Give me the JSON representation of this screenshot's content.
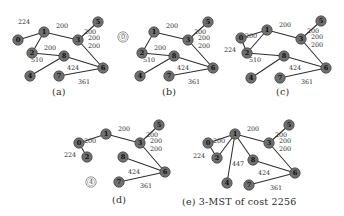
{
  "figure": {
    "type": "graph-algorithm-diagram",
    "node_fill_color": "#6f6f6f",
    "edge_color": "#2e2e2e",
    "open_node_color": "#ffffff",
    "panels": [
      {
        "id": "a",
        "caption": "(a)",
        "nodes": [
          {
            "id": "n0",
            "label": "0",
            "x": 16,
            "y": 40,
            "state": "filled"
          },
          {
            "id": "n1",
            "label": "1",
            "x": 42,
            "y": 32,
            "state": "filled"
          },
          {
            "id": "n2",
            "label": "2",
            "x": 30,
            "y": 53,
            "state": "filled"
          },
          {
            "id": "n3",
            "label": "3",
            "x": 76,
            "y": 40,
            "state": "filled"
          },
          {
            "id": "n5",
            "label": "5",
            "x": 96,
            "y": 22,
            "state": "filled"
          },
          {
            "id": "n8",
            "label": "8",
            "x": 62,
            "y": 56,
            "state": "filled"
          },
          {
            "id": "n4",
            "label": "4",
            "x": 28,
            "y": 76,
            "state": "filled"
          },
          {
            "id": "n7",
            "label": "7",
            "x": 57,
            "y": 76,
            "state": "filled"
          },
          {
            "id": "n6",
            "label": "6",
            "x": 101,
            "y": 68,
            "state": "filled"
          }
        ],
        "edges": [
          {
            "from": "n0",
            "to": "n1",
            "weight": "224",
            "wx": 22,
            "wy": 22
          },
          {
            "from": "n1",
            "to": "n2",
            "weight": "510",
            "wx": 35,
            "wy": 60
          },
          {
            "from": "n1",
            "to": "n3",
            "weight": "200",
            "wx": 60,
            "wy": 26
          },
          {
            "from": "n3",
            "to": "n5",
            "weight": "200",
            "wx": 88,
            "wy": 32
          },
          {
            "from": "n3",
            "to": "n6",
            "weight": "200",
            "wx": 92,
            "wy": 46
          },
          {
            "from": "n2",
            "to": "n8",
            "weight": "200",
            "wx": 48,
            "wy": 48
          },
          {
            "from": "n8",
            "to": "n4",
            "weight": "",
            "wx": 0,
            "wy": 0
          },
          {
            "from": "n8",
            "to": "n6",
            "weight": "424",
            "wx": 71,
            "wy": 68
          },
          {
            "from": "n7",
            "to": "n6",
            "weight": "361",
            "wx": 82,
            "wy": 82
          }
        ],
        "extra_weights": [
          {
            "text": "200",
            "x": 92,
            "y": 38
          }
        ]
      },
      {
        "id": "b",
        "caption": "(b)",
        "nodes": [
          {
            "id": "n0",
            "label": "0",
            "x": 11,
            "y": 37,
            "state": "open"
          },
          {
            "id": "n1",
            "label": "1",
            "x": 42,
            "y": 32,
            "state": "filled"
          },
          {
            "id": "n2",
            "label": "2",
            "x": 30,
            "y": 53,
            "state": "filled"
          },
          {
            "id": "n3",
            "label": "3",
            "x": 76,
            "y": 40,
            "state": "filled"
          },
          {
            "id": "n5",
            "label": "5",
            "x": 96,
            "y": 22,
            "state": "filled"
          },
          {
            "id": "n8",
            "label": "8",
            "x": 62,
            "y": 56,
            "state": "filled"
          },
          {
            "id": "n4",
            "label": "4",
            "x": 28,
            "y": 76,
            "state": "filled"
          },
          {
            "id": "n7",
            "label": "7",
            "x": 57,
            "y": 76,
            "state": "filled"
          },
          {
            "id": "n6",
            "label": "6",
            "x": 101,
            "y": 68,
            "state": "filled"
          }
        ],
        "edges": [
          {
            "from": "n1",
            "to": "n2",
            "weight": "510",
            "wx": 37,
            "wy": 60
          },
          {
            "from": "n1",
            "to": "n3",
            "weight": "200",
            "wx": 60,
            "wy": 26
          },
          {
            "from": "n3",
            "to": "n5",
            "weight": "200",
            "wx": 88,
            "wy": 32
          },
          {
            "from": "n3",
            "to": "n6",
            "weight": "200",
            "wx": 92,
            "wy": 46
          },
          {
            "from": "n2",
            "to": "n8",
            "weight": "200",
            "wx": 48,
            "wy": 48
          },
          {
            "from": "n8",
            "to": "n4",
            "weight": "",
            "wx": 0,
            "wy": 0
          },
          {
            "from": "n8",
            "to": "n6",
            "weight": "424",
            "wx": 71,
            "wy": 68
          },
          {
            "from": "n7",
            "to": "n6",
            "weight": "361",
            "wx": 82,
            "wy": 82
          }
        ],
        "extra_weights": [
          {
            "text": "200",
            "x": 92,
            "y": 38
          }
        ]
      },
      {
        "id": "c",
        "caption": "(c)",
        "nodes": [
          {
            "id": "n0",
            "label": "0",
            "x": 19,
            "y": 36,
            "state": "filled"
          },
          {
            "id": "n1",
            "label": "1",
            "x": 45,
            "y": 28,
            "state": "filled"
          },
          {
            "id": "n2",
            "label": "2",
            "x": 25,
            "y": 51,
            "state": "filled"
          },
          {
            "id": "n3",
            "label": "3",
            "x": 79,
            "y": 37,
            "state": "filled"
          },
          {
            "id": "n5",
            "label": "5",
            "x": 99,
            "y": 19,
            "state": "filled"
          },
          {
            "id": "n8",
            "label": "8",
            "x": 62,
            "y": 54,
            "state": "filled"
          },
          {
            "id": "n4",
            "label": "4",
            "x": 29,
            "y": 76,
            "state": "filled"
          },
          {
            "id": "n7",
            "label": "7",
            "x": 58,
            "y": 76,
            "state": "filled"
          },
          {
            "id": "n6",
            "label": "6",
            "x": 104,
            "y": 66,
            "state": "filled"
          }
        ],
        "edges": [
          {
            "from": "n0",
            "to": "n2",
            "weight": "200",
            "wx": 29,
            "wy": 34
          },
          {
            "from": "n0",
            "to": "n1",
            "weight": "",
            "wx": 0,
            "wy": 0
          },
          {
            "from": "n1",
            "to": "n2",
            "weight": "510",
            "wx": 33,
            "wy": 58
          },
          {
            "from": "n1",
            "to": "n3",
            "weight": "200",
            "wx": 63,
            "wy": 23
          },
          {
            "from": "n3",
            "to": "n5",
            "weight": "200",
            "wx": 91,
            "wy": 29
          },
          {
            "from": "n3",
            "to": "n6",
            "weight": "200",
            "wx": 95,
            "wy": 43
          },
          {
            "from": "n2",
            "to": "n8",
            "weight": "",
            "wx": 0,
            "wy": 0
          },
          {
            "from": "n8",
            "to": "n4",
            "weight": "",
            "wx": 0,
            "wy": 0
          },
          {
            "from": "n8",
            "to": "n6",
            "weight": "424",
            "wx": 73,
            "wy": 66
          },
          {
            "from": "n7",
            "to": "n6",
            "weight": "361",
            "wx": 85,
            "wy": 80
          }
        ],
        "extra_weights": [
          {
            "text": "224",
            "x": 8,
            "y": 48
          },
          {
            "text": "200",
            "x": 95,
            "y": 35
          }
        ]
      },
      {
        "id": "d",
        "caption": "(d)",
        "nodes": [
          {
            "id": "n0",
            "label": "0",
            "x": 19,
            "y": 33,
            "state": "filled"
          },
          {
            "id": "n1",
            "label": "1",
            "x": 46,
            "y": 24,
            "state": "filled"
          },
          {
            "id": "n2",
            "label": "2",
            "x": 27,
            "y": 47,
            "state": "filled"
          },
          {
            "id": "n3",
            "label": "3",
            "x": 80,
            "y": 33,
            "state": "filled"
          },
          {
            "id": "n5",
            "label": "5",
            "x": 99,
            "y": 15,
            "state": "filled"
          },
          {
            "id": "n8",
            "label": "8",
            "x": 63,
            "y": 47,
            "state": "filled"
          },
          {
            "id": "n4",
            "label": "4",
            "x": 31,
            "y": 72,
            "state": "open"
          },
          {
            "id": "n7",
            "label": "7",
            "x": 59,
            "y": 72,
            "state": "filled"
          },
          {
            "id": "n6",
            "label": "6",
            "x": 105,
            "y": 62,
            "state": "filled"
          }
        ],
        "edges": [
          {
            "from": "n0",
            "to": "n2",
            "weight": "200",
            "wx": 30,
            "wy": 31
          },
          {
            "from": "n0",
            "to": "n1",
            "weight": "",
            "wx": 0,
            "wy": 0
          },
          {
            "from": "n1",
            "to": "n3",
            "weight": "200",
            "wx": 64,
            "wy": 19
          },
          {
            "from": "n3",
            "to": "n5",
            "weight": "200",
            "wx": 92,
            "wy": 25
          },
          {
            "from": "n3",
            "to": "n6",
            "weight": "200",
            "wx": 96,
            "wy": 39
          },
          {
            "from": "n8",
            "to": "n6",
            "weight": "424",
            "wx": 74,
            "wy": 62
          },
          {
            "from": "n7",
            "to": "n6",
            "weight": "361",
            "wx": 86,
            "wy": 76
          }
        ],
        "extra_weights": [
          {
            "text": "224",
            "x": 10,
            "y": 45
          },
          {
            "text": "200",
            "x": 96,
            "y": 31
          }
        ]
      },
      {
        "id": "e",
        "caption": "(e) 3-MST of cost 2256",
        "nodes": [
          {
            "id": "n0",
            "label": "0",
            "x": 22,
            "y": 33,
            "state": "filled"
          },
          {
            "id": "n1",
            "label": "1",
            "x": 49,
            "y": 24,
            "state": "filled"
          },
          {
            "id": "n2",
            "label": "2",
            "x": 31,
            "y": 48,
            "state": "filled"
          },
          {
            "id": "n3",
            "label": "3",
            "x": 83,
            "y": 33,
            "state": "filled"
          },
          {
            "id": "n5",
            "label": "5",
            "x": 103,
            "y": 15,
            "state": "filled"
          },
          {
            "id": "n8",
            "label": "8",
            "x": 67,
            "y": 50,
            "state": "filled"
          },
          {
            "id": "n4",
            "label": "4",
            "x": 41,
            "y": 73,
            "state": "filled"
          },
          {
            "id": "n7",
            "label": "7",
            "x": 63,
            "y": 75,
            "state": "filled"
          },
          {
            "id": "n6",
            "label": "6",
            "x": 109,
            "y": 63,
            "state": "filled"
          }
        ],
        "edges": [
          {
            "from": "n0",
            "to": "n2",
            "weight": "200",
            "wx": 33,
            "wy": 31
          },
          {
            "from": "n0",
            "to": "n1",
            "weight": "",
            "wx": 0,
            "wy": 0
          },
          {
            "from": "n1",
            "to": "n2",
            "weight": "",
            "wx": 0,
            "wy": 0
          },
          {
            "from": "n1",
            "to": "n3",
            "weight": "200",
            "wx": 67,
            "wy": 19
          },
          {
            "from": "n1",
            "to": "n4",
            "weight": "",
            "wx": 0,
            "wy": 0
          },
          {
            "from": "n1",
            "to": "n8",
            "weight": "447",
            "wx": 52,
            "wy": 54
          },
          {
            "from": "n3",
            "to": "n5",
            "weight": "200",
            "wx": 95,
            "wy": 25
          },
          {
            "from": "n3",
            "to": "n6",
            "weight": "200",
            "wx": 99,
            "wy": 39
          },
          {
            "from": "n8",
            "to": "n6",
            "weight": "424",
            "wx": 78,
            "wy": 63
          },
          {
            "from": "n7",
            "to": "n6",
            "weight": "361",
            "wx": 90,
            "wy": 78
          }
        ],
        "extra_weights": [
          {
            "text": "224",
            "x": 13,
            "y": 46
          },
          {
            "text": "200",
            "x": 99,
            "y": 31
          }
        ]
      }
    ]
  }
}
